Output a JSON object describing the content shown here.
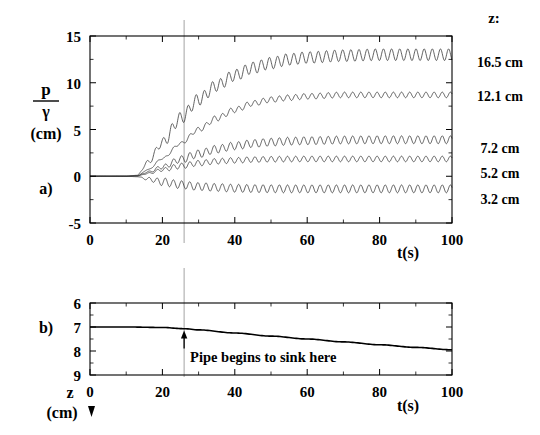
{
  "figure": {
    "panel_a_tag": "a)",
    "panel_b_tag": "b)",
    "legend_header": "z:",
    "annotation": "Pipe begins to sink here",
    "axis_color": "#000000",
    "curve_color": "#3a3a3a",
    "marker_color": "#9a9a9a"
  },
  "panel_a": {
    "ylabel_num": "p",
    "ylabel_den": "γ",
    "ylabel_unit": "(cm)",
    "xlabel": "t(s)",
    "ytick_labels": [
      "15",
      "10",
      "5",
      "0",
      "-5"
    ],
    "xtick_labels": [
      "0",
      "20",
      "40",
      "60",
      "80",
      "100"
    ]
  },
  "panel_b": {
    "ylabel_sym": "z",
    "ylabel_unit": "(cm)",
    "xlabel": "t(s)",
    "ytick_labels": [
      "6",
      "7",
      "8",
      "9"
    ],
    "xtick_labels": [
      "0",
      "20",
      "40",
      "60",
      "80",
      "100"
    ]
  },
  "legend": {
    "items": [
      "16.5 cm",
      "12.1 cm",
      "7.2 cm",
      "5.2 cm",
      "3.2 cm"
    ]
  },
  "chart_data": [
    {
      "type": "line",
      "id": "panel-a",
      "title": "",
      "xlabel": "t(s)",
      "ylabel": "p/γ (cm)",
      "xlim": [
        0,
        100
      ],
      "ylim": [
        -5,
        15
      ],
      "xticks": [
        0,
        20,
        40,
        60,
        80,
        100
      ],
      "yticks": [
        -5,
        0,
        5,
        10,
        15
      ],
      "xminor_step": 10,
      "yminor_step": 2.5,
      "grid": false,
      "legend_position": "right-outside",
      "annotations": [
        {
          "type": "vline",
          "x": 26,
          "label": "pipe-sink-marker"
        }
      ],
      "series": [
        {
          "name": "16.5 cm",
          "onset_t": 13.0,
          "plateau": 13.0,
          "rise_tau": 19.0,
          "osc_amp": 0.62,
          "osc_period": 2.25,
          "osc_grow_t": 22.0,
          "sample_t": [
            0,
            5,
            10,
            13,
            16,
            20,
            25,
            30,
            35,
            40,
            45,
            50,
            55,
            60,
            70,
            80,
            90,
            100
          ],
          "sample_y": [
            0,
            0,
            0,
            0.1,
            1.5,
            3.6,
            6.2,
            8.2,
            9.7,
            10.8,
            11.6,
            12.1,
            12.5,
            12.7,
            12.9,
            13.0,
            13.0,
            13.0
          ]
        },
        {
          "name": "12.1 cm",
          "onset_t": 13.5,
          "plateau": 8.7,
          "rise_tau": 22.0,
          "osc_amp": 0.3,
          "osc_period": 2.25,
          "osc_grow_t": 34.0,
          "sample_t": [
            0,
            5,
            10,
            13,
            16,
            20,
            25,
            30,
            35,
            40,
            45,
            50,
            55,
            60,
            70,
            80,
            90,
            100
          ],
          "sample_y": [
            0,
            0,
            0,
            0.05,
            0.7,
            1.9,
            3.5,
            5.0,
            6.2,
            7.1,
            7.8,
            8.2,
            8.4,
            8.55,
            8.7,
            8.7,
            8.7,
            8.7
          ]
        },
        {
          "name": "7.2 cm",
          "onset_t": 13.5,
          "plateau": 3.9,
          "rise_tau": 18.0,
          "osc_amp": 0.42,
          "osc_period": 2.25,
          "osc_grow_t": 26.0,
          "sample_t": [
            0,
            5,
            10,
            13,
            16,
            20,
            25,
            30,
            35,
            40,
            45,
            50,
            55,
            60,
            70,
            80,
            90,
            100
          ],
          "sample_y": [
            0,
            0,
            0,
            0.05,
            0.45,
            1.0,
            1.8,
            2.4,
            2.9,
            3.25,
            3.5,
            3.65,
            3.75,
            3.8,
            3.88,
            3.9,
            3.9,
            3.9
          ]
        },
        {
          "name": "5.2 cm",
          "onset_t": 13.5,
          "plateau": 1.85,
          "rise_tau": 15.0,
          "osc_amp": 0.3,
          "osc_period": 2.25,
          "osc_grow_t": 24.0,
          "sample_t": [
            0,
            5,
            10,
            13,
            16,
            20,
            25,
            30,
            35,
            40,
            45,
            50,
            55,
            60,
            70,
            80,
            90,
            100
          ],
          "sample_y": [
            0,
            0,
            0,
            0.03,
            0.3,
            0.7,
            1.1,
            1.4,
            1.6,
            1.7,
            1.78,
            1.82,
            1.84,
            1.85,
            1.85,
            1.85,
            1.85,
            1.85
          ]
        },
        {
          "name": "3.2 cm",
          "onset_t": 13.5,
          "plateau": -1.35,
          "rise_tau": 14.0,
          "osc_amp": 0.42,
          "osc_period": 2.25,
          "osc_grow_t": 20.0,
          "sample_t": [
            0,
            5,
            10,
            13,
            16,
            20,
            25,
            30,
            35,
            40,
            45,
            50,
            55,
            60,
            70,
            80,
            90,
            100
          ],
          "sample_y": [
            0,
            0,
            0,
            -0.05,
            -0.3,
            -0.6,
            -0.9,
            -1.1,
            -1.2,
            -1.28,
            -1.32,
            -1.34,
            -1.35,
            -1.35,
            -1.35,
            -1.35,
            -1.35,
            -1.35
          ]
        }
      ]
    },
    {
      "type": "line",
      "id": "panel-b",
      "title": "",
      "xlabel": "t(s)",
      "ylabel": "z (cm)",
      "xlim": [
        0,
        100
      ],
      "ylim": [
        6,
        9
      ],
      "y_inverted": true,
      "xticks": [
        0,
        20,
        40,
        60,
        80,
        100
      ],
      "yticks": [
        6,
        7,
        8,
        9
      ],
      "xminor_step": 10,
      "yminor_step": 0.5,
      "grid": false,
      "annotations": [
        {
          "type": "vline",
          "x": 26,
          "label": "pipe-sink-marker"
        },
        {
          "type": "arrow-up",
          "x": 26,
          "y": 7.1,
          "text": "Pipe begins to sink here"
        }
      ],
      "series": [
        {
          "name": "pipe depth",
          "sample_t": [
            0,
            10,
            20,
            26,
            30,
            40,
            50,
            60,
            70,
            80,
            90,
            100
          ],
          "sample_y": [
            7.0,
            7.0,
            7.02,
            7.07,
            7.12,
            7.25,
            7.38,
            7.5,
            7.62,
            7.74,
            7.85,
            7.95
          ]
        }
      ]
    }
  ]
}
